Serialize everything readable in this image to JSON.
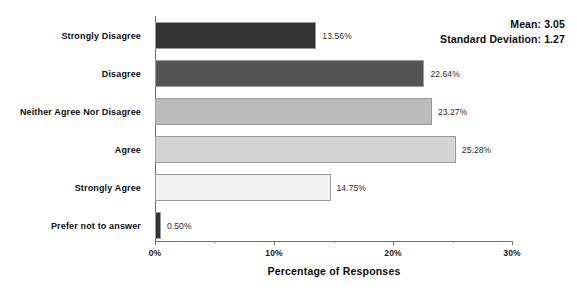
{
  "chart_data": {
    "type": "bar",
    "orientation": "horizontal",
    "title": "",
    "xlabel": "Percentage of Responses",
    "ylabel": "",
    "xlim": [
      0,
      30
    ],
    "xticks": [
      "0%",
      "10%",
      "20%",
      "30%"
    ],
    "xtick_values": [
      0,
      10,
      20,
      30
    ],
    "grid": false,
    "legend": false,
    "categories": [
      "Strongly Disagree",
      "Disagree",
      "Neither Agree Nor Disagree",
      "Agree",
      "Strongly Agree",
      "Prefer not to answer"
    ],
    "values": [
      13.56,
      22.64,
      23.27,
      25.28,
      14.75,
      0.5
    ],
    "value_labels": [
      "13.56%",
      "22.64%",
      "23.27%",
      "25.28%",
      "14.75%",
      "0.50%"
    ],
    "bar_colors": [
      "#333333",
      "#555555",
      "#bbbbbb",
      "#d4d4d4",
      "#f2f2f2",
      "#333333"
    ],
    "annotations": {
      "mean_label": "Mean: 3.05",
      "std_label": "Standard Deviation: 1.27",
      "mean": 3.05,
      "std": 1.27
    }
  }
}
